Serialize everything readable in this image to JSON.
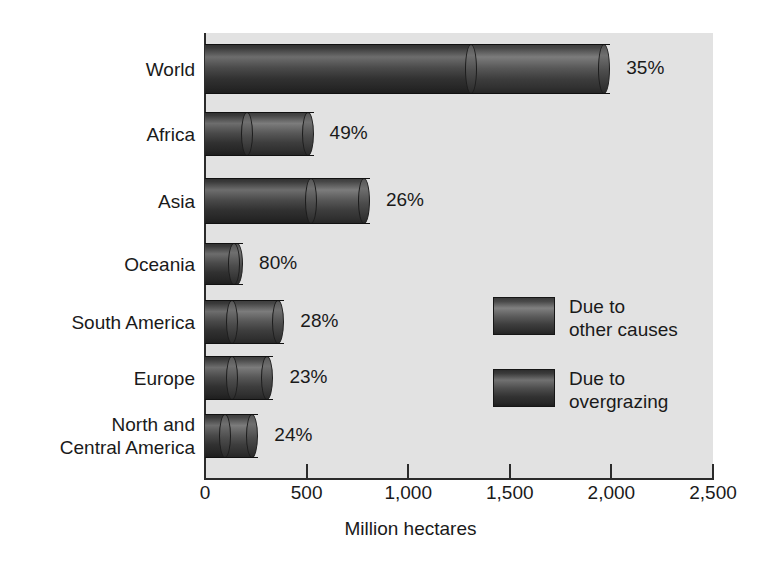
{
  "chart_data": {
    "type": "bar",
    "orientation": "horizontal",
    "stacked": true,
    "title": "",
    "xlabel": "Million hectares",
    "ylabel": "",
    "xlim": [
      0,
      2500
    ],
    "xticks": [
      0,
      500,
      1000,
      1500,
      2000,
      2500
    ],
    "xtick_labels": [
      "0",
      "500",
      "1,000",
      "1,500",
      "2,000",
      "2,500"
    ],
    "grid": false,
    "legend_position": "inside-right-middle",
    "categories": [
      "World",
      "Africa",
      "Asia",
      "Oceania",
      "South America",
      "Europe",
      "North and\nCentral America"
    ],
    "series": [
      {
        "name": "Due to overgrazing",
        "values": [
          1310,
          208,
          520,
          145,
          134,
          134,
          99
        ]
      },
      {
        "name": "Due to other causes",
        "values": [
          655,
          297,
          262,
          13,
          227,
          173,
          134
        ]
      }
    ],
    "totals": [
      1965,
      505,
      782,
      158,
      361,
      307,
      233
    ],
    "point_labels": [
      "35%",
      "49%",
      "26%",
      "80%",
      "28%",
      "23%",
      "24%"
    ],
    "legend_entries": [
      "Due to\nother causes",
      "Due to\novergrazing"
    ],
    "colors": {
      "overgrazing": "#3a3a3a",
      "other_causes": "#5a5a5a",
      "plot_background": "#e2e2e2",
      "axis": "#2b2b2b",
      "text": "#1a1a1a",
      "figure_background": "#ffffff"
    }
  },
  "axis": {
    "x_title": "Million hectares",
    "ticks": [
      {
        "label": "0",
        "value": 0
      },
      {
        "label": "500",
        "value": 500
      },
      {
        "label": "1,000",
        "value": 1000
      },
      {
        "label": "1,500",
        "value": 1500
      },
      {
        "label": "2,000",
        "value": 2000
      },
      {
        "label": "2,500",
        "value": 2500
      }
    ]
  },
  "bars": [
    {
      "label": "World",
      "overgrazing": 1310,
      "other": 655,
      "total": 1965,
      "pct": "35%"
    },
    {
      "label": "Africa",
      "overgrazing": 208,
      "other": 297,
      "total": 505,
      "pct": "49%"
    },
    {
      "label": "Asia",
      "overgrazing": 520,
      "other": 262,
      "total": 782,
      "pct": "26%"
    },
    {
      "label": "Oceania",
      "overgrazing": 145,
      "other": 13,
      "total": 158,
      "pct": "80%"
    },
    {
      "label": "South America",
      "overgrazing": 134,
      "other": 227,
      "total": 361,
      "pct": "28%"
    },
    {
      "label": "Europe",
      "overgrazing": 134,
      "other": 173,
      "total": 307,
      "pct": "23%"
    },
    {
      "label": "North and\nCentral America",
      "overgrazing": 99,
      "other": 134,
      "total": 233,
      "pct": "24%"
    }
  ],
  "legend": {
    "items": [
      {
        "label": "Due to\nother causes",
        "key": "other"
      },
      {
        "label": "Due to\novergrazing",
        "key": "overgrazing"
      }
    ]
  }
}
